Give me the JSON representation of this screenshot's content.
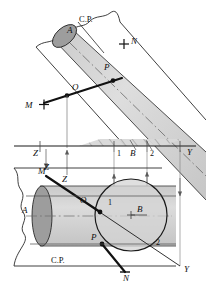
{
  "figure": {
    "colors": {
      "line": "#1a1a1a",
      "thin_line": "#6e6e6e",
      "cylinder_fill": "#d2d2d2",
      "end_ellipse_fill": "#9a9a9a",
      "background": "#ffffff",
      "hatch": "#8a8a8a"
    },
    "views": {
      "top": {
        "name": "top-view",
        "cutting_plane_label": "C.P.",
        "labels": {
          "A": "A",
          "N": "N",
          "P": "P",
          "O": "O",
          "M": "M"
        }
      },
      "front": {
        "name": "front-view",
        "cutting_plane_label": "C.P.",
        "labels": {
          "A": "A",
          "M": "M",
          "Z": "Z",
          "O": "O",
          "B": "B",
          "P": "P",
          "N": "N",
          "one": "1",
          "two": "2",
          "Y_left": "Y",
          "Y_right": "Y"
        }
      }
    },
    "reference_line": {
      "name": "y-y-reference-line",
      "left_label": "Z",
      "tick_labels": [
        "1",
        "B",
        "2"
      ],
      "right_label": "Y"
    },
    "projector_labels": {
      "z_upper": "Z",
      "z_lower": "Z",
      "y_upper": "Y",
      "y_lower": "Y"
    }
  }
}
